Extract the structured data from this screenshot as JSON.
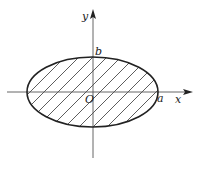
{
  "diagram": {
    "type": "ellipse-region",
    "labels": {
      "x_axis": "x",
      "y_axis": "y",
      "origin": "O",
      "a": "a",
      "b": "b"
    },
    "colors": {
      "stroke": "#222222",
      "axis": "#555555",
      "hatch": "#333333",
      "background": "#ffffff"
    }
  }
}
